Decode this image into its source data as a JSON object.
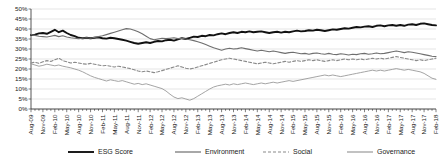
{
  "chart_data": {
    "type": "line",
    "title": "",
    "xlabel": "",
    "ylabel": "",
    "ylim": [
      0,
      50
    ],
    "ytick_labels": [
      "0%",
      "5%",
      "10%",
      "15%",
      "20%",
      "25%",
      "30%",
      "35%",
      "40%",
      "45%",
      "50%"
    ],
    "ytick_values": [
      0,
      5,
      10,
      15,
      20,
      25,
      30,
      35,
      40,
      45,
      50
    ],
    "grid": true,
    "legend_position": "bottom",
    "xtick_labels": [
      "Aug-09",
      "Nov-09",
      "Feb-10",
      "May-10",
      "Aug-10",
      "Nov-10",
      "Feb-11",
      "May-11",
      "Aug-11",
      "Nov-11",
      "Feb-12",
      "May-12",
      "Aug-12",
      "Nov-12",
      "Feb-13",
      "May-13",
      "Aug-13",
      "Nov-13",
      "Feb-14",
      "May-14",
      "Aug-14",
      "Nov-14",
      "Feb-15",
      "May-15",
      "Aug-15",
      "Nov-15",
      "Feb-16",
      "May-16",
      "Aug-16",
      "Nov-16",
      "Feb-17",
      "May-17",
      "Aug-17",
      "Nov-17",
      "Feb-18"
    ],
    "x_start": "Aug-09",
    "x_end": "Feb-18",
    "x_interval": "monthly",
    "n_points": 103,
    "series": [
      {
        "name": "ESG Score",
        "color": "#111111",
        "width": 1.9,
        "dash": "none",
        "values": [
          37.0,
          37.2,
          37.8,
          38.0,
          37.6,
          38.6,
          39.6,
          38.4,
          39.2,
          38.0,
          37.0,
          36.4,
          35.6,
          35.4,
          35.6,
          35.4,
          35.6,
          35.8,
          35.4,
          35.2,
          35.6,
          35.4,
          35.0,
          34.6,
          34.2,
          33.6,
          33.0,
          32.6,
          33.0,
          33.4,
          33.0,
          33.6,
          34.0,
          33.8,
          34.4,
          34.6,
          34.2,
          34.8,
          35.4,
          35.0,
          35.6,
          36.2,
          36.0,
          36.6,
          36.4,
          37.0,
          36.8,
          37.4,
          37.8,
          37.4,
          38.0,
          38.4,
          38.0,
          38.6,
          38.4,
          38.8,
          38.4,
          38.6,
          38.8,
          38.4,
          38.0,
          38.4,
          38.6,
          38.2,
          38.6,
          38.4,
          38.8,
          39.2,
          38.8,
          39.0,
          39.4,
          39.2,
          39.6,
          39.4,
          39.0,
          39.4,
          39.8,
          39.6,
          40.0,
          40.4,
          40.2,
          40.6,
          41.0,
          40.8,
          41.2,
          41.4,
          41.0,
          41.6,
          41.8,
          41.4,
          41.8,
          42.0,
          41.6,
          42.0,
          41.6,
          42.2,
          42.4,
          42.0,
          42.6,
          42.8,
          42.4,
          42.0,
          41.8
        ]
      },
      {
        "name": "Environment",
        "color": "#6e6e6e",
        "width": 1.1,
        "dash": "none",
        "values": [
          37.2,
          36.8,
          36.4,
          36.2,
          36.0,
          36.4,
          36.8,
          36.2,
          36.6,
          36.0,
          35.6,
          35.4,
          35.2,
          35.4,
          35.6,
          35.4,
          35.8,
          36.2,
          36.6,
          37.2,
          37.8,
          38.4,
          39.0,
          39.6,
          40.2,
          40.0,
          39.4,
          38.6,
          37.6,
          36.4,
          35.2,
          34.6,
          35.0,
          35.4,
          35.2,
          35.4,
          35.6,
          35.2,
          35.4,
          35.0,
          34.6,
          34.2,
          33.6,
          33.0,
          32.2,
          31.4,
          30.6,
          30.0,
          29.4,
          30.0,
          30.4,
          30.0,
          30.2,
          30.6,
          30.2,
          29.8,
          29.4,
          29.0,
          29.4,
          29.0,
          28.6,
          29.0,
          28.6,
          28.2,
          27.8,
          28.2,
          28.4,
          28.0,
          27.6,
          27.8,
          27.4,
          27.8,
          28.0,
          27.6,
          27.4,
          27.8,
          27.4,
          27.2,
          27.6,
          27.4,
          27.0,
          27.4,
          27.2,
          27.6,
          27.8,
          27.4,
          27.6,
          28.0,
          27.6,
          27.8,
          28.2,
          28.6,
          29.0,
          28.6,
          28.2,
          28.6,
          28.4,
          28.0,
          27.6,
          27.2,
          26.8,
          26.4,
          26.2
        ]
      },
      {
        "name": "Social",
        "color": "#8a8a8a",
        "width": 1.1,
        "dash": "3,2",
        "values": [
          23.0,
          23.4,
          22.8,
          23.6,
          24.2,
          23.8,
          24.6,
          25.4,
          24.2,
          23.6,
          23.0,
          23.4,
          23.0,
          22.6,
          22.4,
          22.8,
          22.4,
          22.0,
          21.6,
          21.8,
          21.4,
          21.0,
          21.4,
          21.0,
          20.6,
          20.2,
          19.6,
          19.0,
          18.6,
          19.0,
          18.6,
          18.2,
          18.6,
          19.2,
          19.8,
          20.4,
          21.0,
          21.6,
          21.0,
          20.4,
          20.0,
          20.4,
          21.0,
          21.6,
          22.2,
          22.8,
          23.4,
          24.0,
          24.6,
          25.0,
          25.4,
          25.0,
          24.6,
          24.2,
          23.8,
          23.4,
          23.0,
          22.6,
          23.0,
          23.4,
          23.0,
          22.6,
          23.0,
          23.4,
          23.8,
          23.4,
          23.8,
          24.2,
          23.8,
          24.2,
          24.6,
          24.2,
          24.6,
          24.2,
          23.8,
          24.2,
          24.6,
          24.2,
          24.6,
          25.0,
          24.6,
          25.0,
          24.6,
          25.0,
          24.6,
          25.0,
          25.4,
          25.0,
          25.4,
          25.0,
          25.4,
          25.8,
          26.2,
          25.8,
          25.4,
          25.0,
          24.6,
          24.2,
          24.6,
          24.2,
          24.6,
          25.0,
          25.4
        ]
      },
      {
        "name": "Governance",
        "color": "#9a9a9a",
        "width": 0.9,
        "dash": "none",
        "values": [
          22.6,
          22.0,
          21.4,
          21.8,
          22.4,
          22.0,
          21.6,
          22.0,
          21.4,
          21.0,
          20.6,
          20.0,
          19.4,
          18.6,
          17.6,
          16.6,
          15.8,
          15.2,
          14.6,
          14.0,
          14.6,
          14.2,
          13.8,
          14.2,
          13.6,
          13.0,
          12.4,
          12.8,
          12.2,
          12.6,
          12.0,
          11.4,
          10.8,
          10.2,
          9.0,
          7.4,
          6.0,
          5.2,
          5.6,
          5.0,
          4.4,
          5.2,
          6.4,
          7.6,
          8.8,
          10.0,
          11.0,
          11.6,
          12.0,
          12.4,
          12.0,
          12.6,
          12.2,
          12.6,
          13.0,
          12.6,
          12.2,
          12.6,
          13.0,
          12.6,
          13.0,
          13.4,
          13.0,
          13.4,
          13.8,
          14.2,
          13.8,
          14.2,
          14.6,
          15.0,
          15.4,
          15.8,
          16.2,
          16.6,
          17.0,
          16.6,
          17.0,
          16.6,
          16.2,
          16.6,
          17.0,
          17.4,
          17.8,
          18.2,
          18.6,
          19.0,
          19.4,
          19.0,
          19.4,
          19.0,
          19.4,
          19.8,
          20.2,
          19.8,
          19.4,
          19.8,
          19.4,
          19.0,
          18.6,
          17.8,
          16.6,
          15.4,
          14.8
        ]
      }
    ]
  },
  "legend": {
    "items": [
      {
        "label": "ESG Score"
      },
      {
        "label": "Environment"
      },
      {
        "label": "Social"
      },
      {
        "label": "Governance"
      }
    ]
  }
}
